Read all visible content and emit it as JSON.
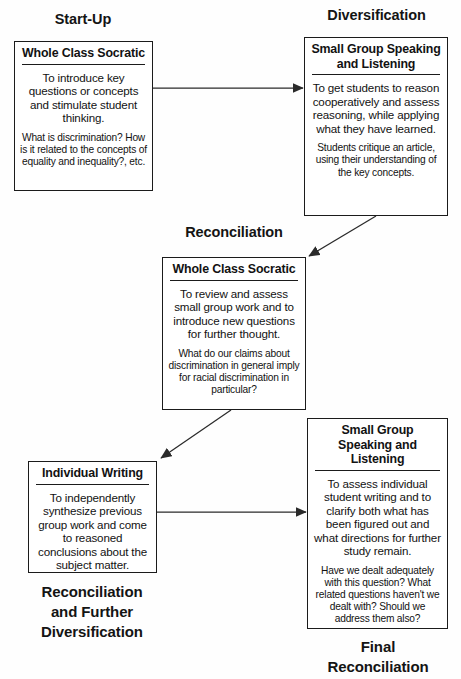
{
  "diagram": {
    "title_alt": "Start-Up / Diversification / Reconciliation cycle",
    "stage_labels": [
      {
        "id": "start-up",
        "text": "Start-Up"
      },
      {
        "id": "diversification",
        "text": "Diversification"
      },
      {
        "id": "reconciliation",
        "text": "Reconciliation"
      },
      {
        "id": "reconciliation-and-further-diversification",
        "text": "Reconciliation\nand Further\nDiversification"
      },
      {
        "id": "final-reconciliation",
        "text": "Final\nReconciliation"
      }
    ],
    "nodes": [
      {
        "id": "whole-class-socratic-1",
        "title": "Whole Class Socratic",
        "primary": "To introduce key questions or concepts and stimulate student thinking.",
        "secondary": "What is discrimination? How is it related to the concepts of equality and inequality?, etc."
      },
      {
        "id": "small-group-speaking-listening-1",
        "title": "Small Group Speaking and Listening",
        "primary": "To get students to reason cooperatively and assess reasoning, while applying what they have learned.",
        "secondary": "Students critique an article, using their understanding of the key concepts."
      },
      {
        "id": "whole-class-socratic-2",
        "title": "Whole Class Socratic",
        "primary": "To review and assess small group work and to introduce new questions for further thought.",
        "secondary": "What do our claims about discrimination in general imply for racial discrimination in particular?"
      },
      {
        "id": "individual-writing",
        "title": "Individual Writing",
        "primary": "To independently synthesize previous group work and come to reasoned conclusions about the subject matter.",
        "secondary": ""
      },
      {
        "id": "small-group-speaking-listening-2",
        "title": "Small Group Speaking and Listening",
        "primary": "To assess individual student writing and to clarify both what has been figured out and what directions for further study remain.",
        "secondary": "Have we dealt adequately with this question? What related questions haven't we dealt with? Should we address them also?"
      }
    ],
    "connectors": [
      {
        "id": "arrow-start-up-to-diversification",
        "kind": "horizontal-right"
      },
      {
        "id": "arrow-diversification-to-reconciliation",
        "kind": "diagonal-down-left"
      },
      {
        "id": "arrow-reconciliation-to-individual-writing",
        "kind": "diagonal-down-left"
      },
      {
        "id": "arrow-individual-writing-to-final-reconciliation",
        "kind": "horizontal-right"
      }
    ],
    "colors": {
      "ink": "#1b1b1b",
      "paper": "#fefefe",
      "arrow": "#2a2a2a"
    }
  }
}
